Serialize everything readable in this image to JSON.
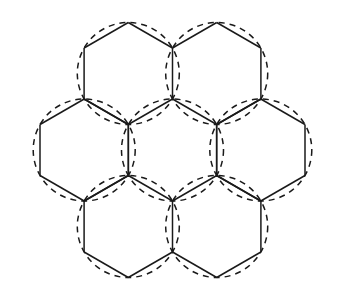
{
  "figure": {
    "background_color": "#ffffff",
    "stroke_color": "#1a1a1a",
    "hexagon_stroke_width": 1.5,
    "circle_stroke_width": 1.5,
    "circle_dash_pattern": "6 5",
    "canvas": {
      "width": 341,
      "height": 298
    }
  },
  "chart_data": {
    "type": "diagram",
    "geometry": {
      "hexagon_orientation": "pointy-top",
      "circumradius": 51,
      "apothem": 44.2,
      "center_spacing": 88.3,
      "cluster_size": 7
    },
    "cells": [
      {
        "id": "cell-center",
        "label": "center",
        "cx": 172.5,
        "cy": 150.0,
        "r": 51
      },
      {
        "id": "cell-top-left",
        "label": "top-left",
        "cx": 128.3,
        "cy": 73.5,
        "r": 51
      },
      {
        "id": "cell-top-right",
        "label": "top-right",
        "cx": 216.7,
        "cy": 73.5,
        "r": 51
      },
      {
        "id": "cell-left",
        "label": "left",
        "cx": 84.2,
        "cy": 150.0,
        "r": 51
      },
      {
        "id": "cell-right",
        "label": "right",
        "cx": 260.8,
        "cy": 150.0,
        "r": 51
      },
      {
        "id": "cell-bottom-left",
        "label": "bottom-left",
        "cx": 128.3,
        "cy": 226.5,
        "r": 51
      },
      {
        "id": "cell-bottom-right",
        "label": "bottom-right",
        "cx": 216.7,
        "cy": 226.5,
        "r": 51
      }
    ],
    "hexagon_vertex_offsets": [
      {
        "dx": 0.0,
        "dy": -51.0
      },
      {
        "dx": 44.2,
        "dy": -25.5
      },
      {
        "dx": 44.2,
        "dy": 25.5
      },
      {
        "dx": 0.0,
        "dy": 51.0
      },
      {
        "dx": -44.2,
        "dy": 25.5
      },
      {
        "dx": -44.2,
        "dy": -25.5
      }
    ]
  }
}
